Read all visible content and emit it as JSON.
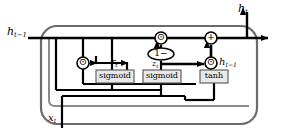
{
  "diagram": {
    "colors": {
      "line": "#000000",
      "cell_border": "#6b6b6b",
      "gate_fill": "#e8e8e8",
      "gate_border": "#555555",
      "node_fill": "#ffffff",
      "background": "#ffffff"
    },
    "io_labels": [
      {
        "id": "h-prev-input",
        "base": "h",
        "sub": "t−1",
        "x": 7,
        "y": 28
      },
      {
        "id": "h-t-output",
        "base": "h",
        "sub": "t",
        "x": 243,
        "y": 4
      },
      {
        "id": "x-t-input",
        "base": "x",
        "sub": "t",
        "x": 48,
        "y": 114
      }
    ],
    "signal_labels": [
      {
        "id": "reset-gate-label",
        "base": "r",
        "sub": "t",
        "x": 105,
        "y": 60
      },
      {
        "id": "update-gate-label",
        "base": "z",
        "sub": "t",
        "x": 152,
        "y": 60
      },
      {
        "id": "candidate-state-label",
        "base": "h",
        "sub": "t−1",
        "x": 222,
        "y": 62
      }
    ],
    "gates": [
      {
        "id": "reset-gate",
        "label": "sigmoid",
        "x": 96,
        "y": 70,
        "w": 38,
        "h": 13
      },
      {
        "id": "update-gate",
        "label": "sigmoid",
        "x": 143,
        "y": 70,
        "w": 38,
        "h": 13
      },
      {
        "id": "candidate-gate",
        "label": "tanh",
        "x": 200,
        "y": 70,
        "w": 28,
        "h": 13
      }
    ],
    "operators": [
      {
        "id": "reset-multiply",
        "symbol": "⊙",
        "cx": 83,
        "cy": 63,
        "r": 6
      },
      {
        "id": "forget-multiply",
        "symbol": "⊙",
        "cx": 161,
        "cy": 38,
        "r": 6
      },
      {
        "id": "update-multiply",
        "symbol": "⊙",
        "cx": 211,
        "cy": 38,
        "r": 6
      },
      {
        "id": "candidate-multiply",
        "symbol": "⊙",
        "cx": 211,
        "cy": 63,
        "r": 6
      },
      {
        "id": "state-add",
        "symbol": "+",
        "cx": 211,
        "cy": 38,
        "r": 6
      }
    ],
    "one_minus_node": {
      "id": "one-minus-node",
      "label": "1−",
      "cx": 161,
      "cy": 54,
      "rx": 13,
      "ry": 6
    }
  }
}
